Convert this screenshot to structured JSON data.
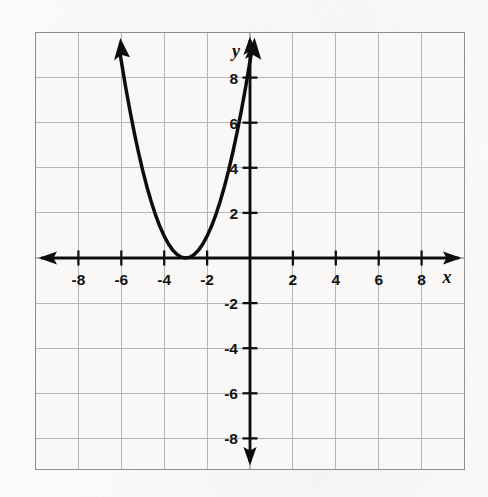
{
  "figure": {
    "kind": "coordinate-grid-graph",
    "background_color": "#faf9f8",
    "border_color": "#9a9a9a",
    "grid_color": "#b4b4b4",
    "axis_color": "#111111",
    "curve_color": "#111111",
    "axis_labels": {
      "x": "x",
      "y": "y"
    }
  },
  "chart_data": {
    "type": "line",
    "title": "",
    "subtitle": "",
    "xlabel": "x",
    "ylabel": "y",
    "xlim": [
      -10,
      10
    ],
    "ylim": [
      -10,
      10
    ],
    "grid": true,
    "grid_step": 2,
    "legend": "none",
    "x_ticks": [
      -8,
      -6,
      -4,
      -2,
      2,
      4,
      6,
      8
    ],
    "x_tick_labels": [
      "-8",
      "-6",
      "-4",
      "-2",
      "2",
      "4",
      "6",
      "8"
    ],
    "y_ticks": [
      8,
      6,
      4,
      2,
      -2,
      -4,
      -6,
      -8
    ],
    "y_tick_labels": [
      "8",
      "6",
      "4",
      "2",
      "-2",
      "-4",
      "-6",
      "-8"
    ],
    "series": [
      {
        "name": "parabola",
        "equation": "y = (x + 3)^2",
        "vertex": [
          -3,
          0
        ],
        "opens": "up",
        "a": 1,
        "h": -3,
        "k": 0,
        "arrow_ends": "both",
        "x": [
          -6.05,
          -5.8,
          -5.6,
          -5.4,
          -5.2,
          -5.0,
          -4.8,
          -4.6,
          -4.4,
          -4.2,
          -4.0,
          -3.8,
          -3.6,
          -3.4,
          -3.2,
          -3.0,
          -2.8,
          -2.6,
          -2.4,
          -2.2,
          -2.0,
          -1.8,
          -1.6,
          -1.4,
          -1.2,
          -1.0,
          -0.8,
          -0.6,
          -0.4,
          -0.2,
          0.0,
          0.05
        ],
        "y": [
          9.3,
          7.84,
          6.76,
          5.76,
          4.84,
          4.0,
          3.24,
          2.56,
          1.96,
          1.44,
          1.0,
          0.64,
          0.36,
          0.16,
          0.04,
          0.0,
          0.04,
          0.16,
          0.36,
          0.64,
          1.0,
          1.44,
          1.96,
          2.56,
          3.24,
          4.0,
          4.84,
          5.76,
          6.76,
          7.84,
          9.0,
          9.3
        ]
      }
    ],
    "notable_points": [
      {
        "label": "vertex",
        "x": -3,
        "y": 0
      },
      {
        "label": "y-intercept",
        "x": 0,
        "y": 9
      },
      {
        "label": "point",
        "x": -1,
        "y": 4
      },
      {
        "label": "point",
        "x": -5,
        "y": 4
      },
      {
        "label": "point",
        "x": -2,
        "y": 1
      },
      {
        "label": "point",
        "x": -4,
        "y": 1
      }
    ]
  }
}
